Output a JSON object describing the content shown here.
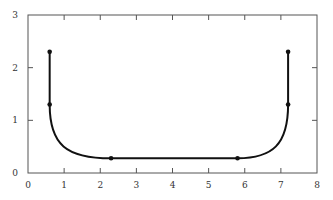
{
  "chart_data": {
    "type": "line",
    "title": "",
    "xlabel": "",
    "ylabel": "",
    "xlim": [
      0,
      8
    ],
    "ylim": [
      0,
      3
    ],
    "x_ticks": [
      "0",
      "1",
      "2",
      "3",
      "4",
      "5",
      "6",
      "7",
      "8"
    ],
    "y_ticks": [
      "0",
      "1",
      "2",
      "3"
    ],
    "grid": false,
    "legend": null,
    "series": [
      {
        "name": "curve",
        "color": "#111111",
        "markers": [
          {
            "x": 0.6,
            "y": 2.3
          },
          {
            "x": 0.6,
            "y": 1.3
          },
          {
            "x": 2.3,
            "y": 0.28
          },
          {
            "x": 5.8,
            "y": 0.28
          },
          {
            "x": 7.2,
            "y": 1.3
          },
          {
            "x": 7.2,
            "y": 2.3
          }
        ]
      }
    ]
  }
}
